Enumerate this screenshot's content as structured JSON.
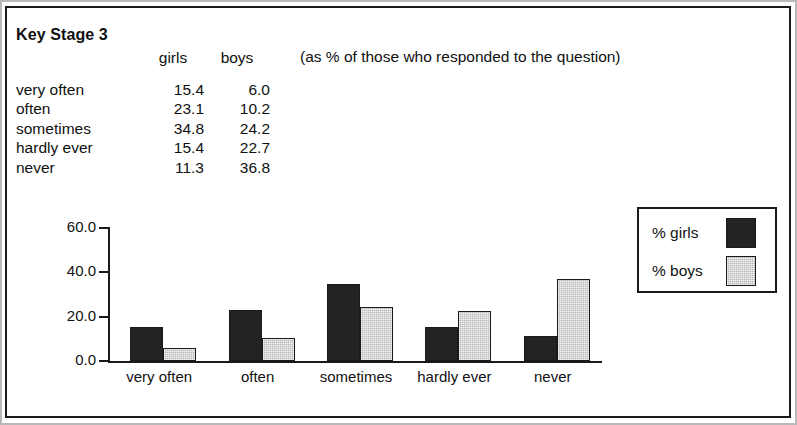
{
  "title": "Key Stage 3",
  "note": "(as % of those who responded to the question)",
  "table": {
    "headers": [
      "",
      "girls",
      "boys"
    ],
    "rows": [
      {
        "label": "very often",
        "girls": "15.4",
        "boys": "6.0"
      },
      {
        "label": "often",
        "girls": "23.1",
        "boys": "10.2"
      },
      {
        "label": "sometimes",
        "girls": "34.8",
        "boys": "24.2"
      },
      {
        "label": "hardly ever",
        "girls": "15.4",
        "boys": "22.7"
      },
      {
        "label": "never",
        "girls": "11.3",
        "boys": "36.8"
      }
    ]
  },
  "legend": {
    "items": [
      {
        "label": "% girls",
        "swatch": "dark-fill-swatch"
      },
      {
        "label": "% boys",
        "swatch": "light-fill-swatch"
      }
    ]
  },
  "chart_data": {
    "type": "bar",
    "title": "",
    "xlabel": "",
    "ylabel": "",
    "categories": [
      "very often",
      "often",
      "sometimes",
      "hardly ever",
      "never"
    ],
    "series": [
      {
        "name": "% girls",
        "values": [
          15.4,
          23.1,
          34.8,
          15.4,
          11.3
        ],
        "color": "#232323"
      },
      {
        "name": "% boys",
        "values": [
          6.0,
          10.2,
          24.2,
          22.7,
          36.8
        ],
        "color": "#b8b8b8"
      }
    ],
    "ylim": [
      0,
      60
    ],
    "yticks": [
      "0.0",
      "20.0",
      "40.0",
      "60.0"
    ],
    "ytick_values": [
      0,
      20,
      40,
      60
    ],
    "grid": false,
    "legend_position": "upper-right-outside"
  },
  "colors": {
    "girls": "#232323",
    "boys": "#b8b8b8",
    "ink": "#111111",
    "frame": "#1a1a1a"
  }
}
